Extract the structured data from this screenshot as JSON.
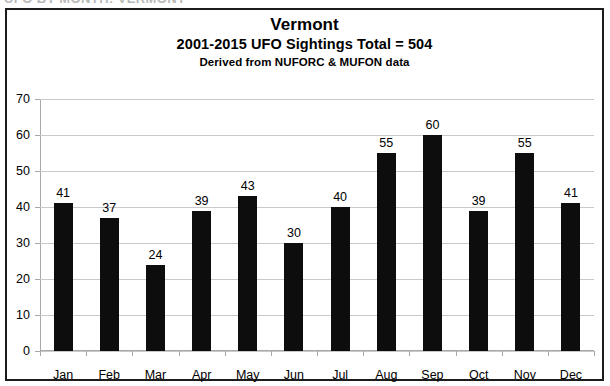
{
  "page": {
    "cut_off_header": "UFO BY MONTH: VERMONT"
  },
  "chart_data": {
    "type": "bar",
    "title": "Vermont",
    "subtitle": "2001-2015 UFO Sightings Total = 504",
    "note": "Derived from NUFORC  &  MUFON data",
    "categories": [
      "Jan",
      "Feb",
      "Mar",
      "Apr",
      "May",
      "Jun",
      "Jul",
      "Aug",
      "Sep",
      "Oct",
      "Nov",
      "Dec"
    ],
    "values": [
      41,
      37,
      24,
      39,
      43,
      30,
      40,
      55,
      60,
      39,
      55,
      41
    ],
    "xlabel": "",
    "ylabel": "",
    "ylim": [
      0,
      70
    ],
    "yticks": [
      70,
      60,
      50,
      40,
      30,
      20,
      10,
      0
    ],
    "grid": true,
    "legend": "none",
    "bar_color": "#0d0d0d",
    "grid_color": "#c9c9c9",
    "axis_color": "#a8a8a8",
    "frame_color": "#1c1c1c",
    "data_labels": true
  }
}
